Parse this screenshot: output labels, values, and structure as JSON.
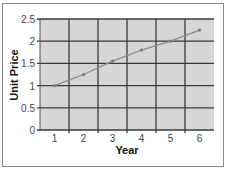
{
  "chart_data": {
    "type": "line",
    "title": "",
    "xlabel": "Year",
    "ylabel": "Unit Price",
    "x": [
      1,
      2,
      3,
      4,
      5,
      6
    ],
    "categories": [
      "1",
      "2",
      "3",
      "4",
      "5",
      "6"
    ],
    "series": [
      {
        "name": "Unit Price",
        "values": [
          1.0,
          1.25,
          1.55,
          1.8,
          2.0,
          2.25
        ]
      }
    ],
    "yticks": [
      "0",
      "0.5",
      "1",
      "1.5",
      "2",
      "2.5"
    ],
    "ylim": [
      0,
      2.5
    ],
    "grid": true,
    "legend": "none",
    "colors": {
      "plot_bg": "#d6d6d6",
      "grid": "#3a3a3a",
      "line": "#8c8c8c",
      "marker": "#7a7a7a"
    }
  }
}
